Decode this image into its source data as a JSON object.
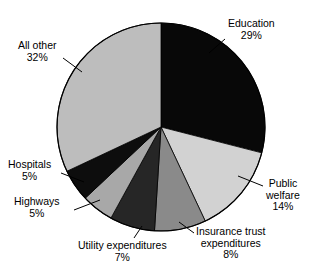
{
  "chart_data": {
    "type": "pie",
    "title": "",
    "subtitle": "",
    "xlabel": "",
    "ylabel": "",
    "legend_position": "none",
    "grid": false,
    "start_angle_deg": 0,
    "direction": "clockwise",
    "center": {
      "x": 161,
      "y": 127
    },
    "radius": 104,
    "categories": [
      "Education",
      "Public welfare",
      "Insurance trust expenditures",
      "Utility expenditures",
      "Highways",
      "Hospitals",
      "All other"
    ],
    "values": [
      29,
      14,
      8,
      7,
      5,
      5,
      32
    ],
    "unit": "%",
    "colors": [
      "#080808",
      "#d2d2d2",
      "#8a8a8a",
      "#262626",
      "#a8a8a8",
      "#0d0d0d",
      "#bdbdbd"
    ],
    "slices": [
      {
        "label": "Education",
        "value": 29,
        "value_text": "29%",
        "color": "#080808",
        "start_deg": 0,
        "end_deg": 104.4,
        "leader": true
      },
      {
        "label": "Public welfare",
        "value": 14,
        "value_text": "14%",
        "color": "#d2d2d2",
        "start_deg": 104.4,
        "end_deg": 154.8,
        "leader": true
      },
      {
        "label": "Insurance trust expenditures",
        "value": 8,
        "value_text": "8%",
        "color": "#8a8a8a",
        "start_deg": 154.8,
        "end_deg": 183.6,
        "leader": true
      },
      {
        "label": "Utility expenditures",
        "value": 7,
        "value_text": "7%",
        "color": "#262626",
        "start_deg": 183.6,
        "end_deg": 208.8,
        "leader": true
      },
      {
        "label": "Highways",
        "value": 5,
        "value_text": "5%",
        "color": "#a8a8a8",
        "start_deg": 208.8,
        "end_deg": 226.8,
        "leader": true
      },
      {
        "label": "Hospitals",
        "value": 5,
        "value_text": "5%",
        "color": "#0d0d0d",
        "start_deg": 226.8,
        "end_deg": 244.8,
        "leader": true
      },
      {
        "label": "All other",
        "value": 32,
        "value_text": "32%",
        "color": "#bdbdbd",
        "start_deg": 244.8,
        "end_deg": 360,
        "leader": true
      }
    ]
  },
  "labels": {
    "education": {
      "name": "Education",
      "value": "29%"
    },
    "public_welfare": {
      "name_line1": "Public",
      "name_line2": "welfare",
      "value": "14%"
    },
    "insurance": {
      "name_line1": "Insurance trust",
      "name_line2": "expenditures",
      "value": "8%"
    },
    "utility": {
      "name": "Utility expenditures",
      "value": "7%"
    },
    "highways": {
      "name": "Highways",
      "value": "5%"
    },
    "hospitals": {
      "name": "Hospitals",
      "value": "5%"
    },
    "all_other": {
      "name": "All other",
      "value": "32%"
    }
  }
}
